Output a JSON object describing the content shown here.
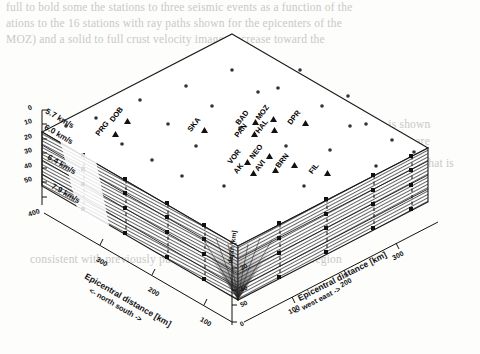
{
  "figure": {
    "kind": "3d-block-diagram"
  },
  "depth_axis": {
    "name": "depth-axis-left",
    "ticks": [
      "0",
      "10",
      "20",
      "30",
      "40",
      "50"
    ],
    "extra_tick": "400"
  },
  "velocity_layers": [
    {
      "label": "5.7 km/s",
      "velocity": 5.7,
      "unit": "km/s"
    },
    {
      "label": "6.0 km/s",
      "velocity": 6.0,
      "unit": "km/s"
    },
    {
      "label": "6.4 km/s",
      "velocity": 6.4,
      "unit": "km/s"
    },
    {
      "label": "7.9 km/s",
      "velocity": 7.9,
      "unit": "km/s"
    }
  ],
  "axis_south": {
    "title": "Epicentral distance [km]",
    "direction": "<- north      south ->",
    "ticks": [
      "300",
      "200",
      "100"
    ]
  },
  "axis_east": {
    "title": "Epicentral distance [km]",
    "direction": "<- west      east ->",
    "ticks": [
      "100",
      "200",
      "300"
    ]
  },
  "axis_depth_front": {
    "title": "depth [km]",
    "ticks": [
      "20",
      "40",
      "50",
      "0"
    ]
  },
  "stations": [
    {
      "code": "DOB",
      "x": 108,
      "y": 110
    },
    {
      "code": "PRG",
      "x": 96,
      "y": 124
    },
    {
      "code": "SKA",
      "x": 186,
      "y": 120
    },
    {
      "code": "BAD",
      "x": 238,
      "y": 112
    },
    {
      "code": "MOZ",
      "x": 258,
      "y": 108
    },
    {
      "code": "PAN",
      "x": 236,
      "y": 124
    },
    {
      "code": "HAL",
      "x": 257,
      "y": 120
    },
    {
      "code": "DPR",
      "x": 289,
      "y": 113
    },
    {
      "code": "VOR",
      "x": 229,
      "y": 152
    },
    {
      "code": "NEO",
      "x": 251,
      "y": 146
    },
    {
      "code": "AK",
      "x": 235,
      "y": 163
    },
    {
      "code": "AVI",
      "x": 257,
      "y": 160
    },
    {
      "code": "BRN",
      "x": 277,
      "y": 155
    },
    {
      "code": "FIL",
      "x": 310,
      "y": 163
    }
  ],
  "bleed_text": [
    "full to bold some the stations to three seismic events as a function of the",
    "ations to the 16 stations with ray paths shown for the epicenters  of  the",
    "MOZ)  and  a  solid  to  full  crust  velocity  images  increase  toward  the",
    "observed  at  all  the  stations  and  the  resulting  ray  coverage  is  shown",
    "ted  arrivals  at  the  stations  in  the  southern  part  of  the  network  are",
    "we  obtain  a  model  that  fits  the  data  to  less  than  0.2 s  and  that  is",
    "consistent with previously published crustal models in the region"
  ],
  "colors": {
    "ink": "#111111",
    "hatch": "#3a3a3a",
    "paper": "#fdfdfc",
    "bleed": "#c9c9c6"
  }
}
